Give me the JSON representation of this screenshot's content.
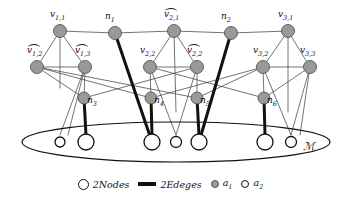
{
  "figure": {
    "colors": {
      "node_fill_a1": "#999999",
      "node_fill_a2": "#ffffff",
      "stroke": "#111111",
      "thin_edge": "#444444",
      "background": "#ffffff"
    }
  },
  "nodes": {
    "top_row": [
      {
        "id": "v11",
        "label": "v",
        "sub": "1,1",
        "tilde": false,
        "x": 60,
        "y": 31,
        "r": 6.5,
        "fill": "a1"
      },
      {
        "id": "n1",
        "label": "n",
        "sub": "1",
        "tilde": false,
        "x": 115,
        "y": 33,
        "r": 6.5,
        "fill": "a1"
      },
      {
        "id": "v21t",
        "label": "v",
        "sub": "2,1",
        "tilde": true,
        "x": 174,
        "y": 31,
        "r": 6.5,
        "fill": "a1"
      },
      {
        "id": "n2",
        "label": "n",
        "sub": "2",
        "tilde": false,
        "x": 231,
        "y": 33,
        "r": 6.5,
        "fill": "a1"
      },
      {
        "id": "v31",
        "label": "v",
        "sub": "3,1",
        "tilde": false,
        "x": 288,
        "y": 31,
        "r": 6.5,
        "fill": "a1"
      }
    ],
    "mid_row": [
      {
        "id": "v12t",
        "label": "v",
        "sub": "1,2",
        "tilde": true,
        "x": 37,
        "y": 67,
        "r": 6.5,
        "fill": "a1"
      },
      {
        "id": "v13t",
        "label": "v",
        "sub": "1,3",
        "tilde": true,
        "x": 85,
        "y": 67,
        "r": 6.5,
        "fill": "a1"
      },
      {
        "id": "v22",
        "label": "v",
        "sub": "2,2",
        "tilde": false,
        "x": 150,
        "y": 67,
        "r": 6.5,
        "fill": "a1"
      },
      {
        "id": "v22t",
        "label": "v",
        "sub": "2,2",
        "tilde": true,
        "x": 197,
        "y": 67,
        "r": 6.5,
        "fill": "a1"
      },
      {
        "id": "v32",
        "label": "v",
        "sub": "3,2",
        "tilde": false,
        "x": 263,
        "y": 67,
        "r": 6.5,
        "fill": "a1"
      },
      {
        "id": "v33",
        "label": "v",
        "sub": "3,3",
        "tilde": false,
        "x": 310,
        "y": 67,
        "r": 6.5,
        "fill": "a1"
      }
    ],
    "low_row": [
      {
        "id": "n3",
        "label": "n",
        "sub": "3",
        "tilde": false,
        "x": 84,
        "y": 98,
        "r": 6.0,
        "fill": "a1"
      },
      {
        "id": "n4",
        "label": "n",
        "sub": "4",
        "tilde": false,
        "x": 151,
        "y": 98,
        "r": 6.0,
        "fill": "a1"
      },
      {
        "id": "n5",
        "label": "n",
        "sub": "5",
        "tilde": false,
        "x": 197,
        "y": 98,
        "r": 6.0,
        "fill": "a1"
      },
      {
        "id": "n6",
        "label": "n",
        "sub": "6",
        "tilde": false,
        "x": 264,
        "y": 98,
        "r": 6.0,
        "fill": "a1"
      }
    ],
    "matching_circles": [
      {
        "id": "m1",
        "x": 60,
        "y": 142,
        "r": 5.0,
        "fill": "a2"
      },
      {
        "id": "m2",
        "x": 86,
        "y": 142,
        "r": 8.0,
        "fill": "a2"
      },
      {
        "id": "m3",
        "x": 152,
        "y": 142,
        "r": 8.0,
        "fill": "a2"
      },
      {
        "id": "m4",
        "x": 176,
        "y": 142,
        "r": 5.5,
        "fill": "a2"
      },
      {
        "id": "m5",
        "x": 199,
        "y": 142,
        "r": 8.0,
        "fill": "a2"
      },
      {
        "id": "m6",
        "x": 265,
        "y": 142,
        "r": 8.0,
        "fill": "a2"
      },
      {
        "id": "m7",
        "x": 291,
        "y": 142,
        "r": 5.5,
        "fill": "a2"
      }
    ]
  },
  "ellipse": {
    "cx": 176,
    "cy": 142,
    "rx": 154,
    "ry": 20,
    "label": "M",
    "label_x": 303,
    "label_y": 150
  },
  "edges_thin": [
    [
      60,
      31,
      115,
      33
    ],
    [
      115,
      33,
      174,
      31
    ],
    [
      174,
      31,
      231,
      33
    ],
    [
      231,
      33,
      288,
      31
    ],
    [
      60,
      31,
      37,
      67
    ],
    [
      60,
      31,
      85,
      67
    ],
    [
      60,
      31,
      60,
      88
    ],
    [
      37,
      67,
      85,
      67
    ],
    [
      37,
      67,
      84,
      98
    ],
    [
      37,
      67,
      151,
      98
    ],
    [
      37,
      67,
      197,
      98
    ],
    [
      85,
      67,
      84,
      98
    ],
    [
      85,
      67,
      60,
      135
    ],
    [
      174,
      31,
      150,
      67
    ],
    [
      174,
      31,
      197,
      67
    ],
    [
      174,
      31,
      176,
      112
    ],
    [
      150,
      67,
      197,
      67
    ],
    [
      150,
      67,
      151,
      98
    ],
    [
      150,
      67,
      176,
      135
    ],
    [
      150,
      67,
      264,
      98
    ],
    [
      197,
      67,
      197,
      98
    ],
    [
      197,
      67,
      176,
      135
    ],
    [
      197,
      67,
      84,
      98
    ],
    [
      288,
      31,
      263,
      67
    ],
    [
      288,
      31,
      310,
      67
    ],
    [
      288,
      31,
      288,
      112
    ],
    [
      263,
      67,
      310,
      67
    ],
    [
      263,
      67,
      264,
      98
    ],
    [
      263,
      67,
      151,
      98
    ],
    [
      263,
      67,
      197,
      98
    ],
    [
      310,
      67,
      264,
      98
    ],
    [
      310,
      67,
      291,
      135
    ],
    [
      310,
      67,
      300,
      135
    ],
    [
      85,
      67,
      68,
      135
    ],
    [
      263,
      67,
      291,
      135
    ]
  ],
  "edges_thick": [
    [
      115,
      33,
      152,
      142
    ],
    [
      231,
      33,
      199,
      142
    ],
    [
      84,
      98,
      86,
      135
    ],
    [
      151,
      98,
      152,
      135
    ],
    [
      197,
      98,
      199,
      135
    ],
    [
      264,
      98,
      265,
      135
    ]
  ],
  "legend": {
    "items": [
      {
        "id": "legend-nodes",
        "swatch": "open-circle",
        "label": "2Nodes"
      },
      {
        "id": "legend-edges",
        "swatch": "thick-bar",
        "label": "2Edeges"
      },
      {
        "id": "legend-a1",
        "swatch": "filled-circle",
        "label": "a",
        "sub": "1"
      },
      {
        "id": "legend-a2",
        "swatch": "open-circle-small",
        "label": "a",
        "sub": "2"
      }
    ]
  }
}
